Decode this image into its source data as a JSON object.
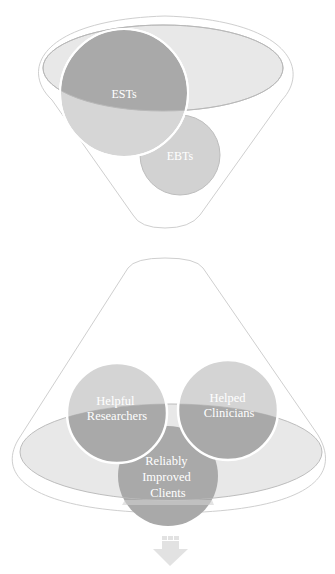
{
  "diagram": {
    "top_funnel": {
      "circles": [
        {
          "id": "ests",
          "label": "ESTs",
          "cx": 124,
          "cy": 93,
          "r": 64,
          "fill": "#a9a9a9"
        },
        {
          "id": "ebts",
          "label": "EBTs",
          "cx": 180,
          "cy": 155,
          "r": 40,
          "fill": "#cfcfcf"
        }
      ],
      "ellipse_fill": "#e8e8e8",
      "outline_color": "#c8c8c8"
    },
    "bottom_funnel": {
      "circles": [
        {
          "id": "helpful-researchers",
          "lines": [
            "Helpful",
            "Researchers"
          ],
          "cx": 117,
          "cy": 413,
          "r": 50
        },
        {
          "id": "helped-clinicians",
          "lines": [
            "Helped",
            "Clinicians"
          ],
          "cx": 228,
          "cy": 410,
          "r": 50
        },
        {
          "id": "reliably-improved-clients",
          "lines": [
            "Reliably",
            "Improved",
            "Clients"
          ],
          "cx": 168,
          "cy": 476,
          "r": 50
        }
      ],
      "ellipse_fill": "#e8e8e8",
      "circle_light": "#d3d3d3",
      "circle_dark": "#a9a9a9",
      "outline_color": "#c8c8c8"
    },
    "arrow": {
      "direction": "down",
      "color": "#e2e2e2"
    }
  }
}
